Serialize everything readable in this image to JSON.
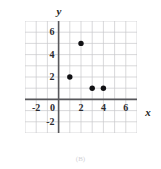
{
  "figure": {
    "caption": "(B)",
    "background_color": "#ffffff"
  },
  "axes": {
    "x_name": "x",
    "y_name": "y",
    "axis_color": "#58585c",
    "grid_color": "#c8c8cc",
    "point_color": "#111114"
  },
  "ticks": {
    "x": [
      {
        "value": -2,
        "label": "-2"
      },
      {
        "value": 0,
        "label": "0"
      },
      {
        "value": 2,
        "label": "2"
      },
      {
        "value": 4,
        "label": "4"
      },
      {
        "value": 6,
        "label": "6"
      }
    ],
    "y": [
      {
        "value": -2,
        "label": "-2"
      },
      {
        "value": 2,
        "label": "2"
      },
      {
        "value": 4,
        "label": "4"
      },
      {
        "value": 6,
        "label": "6"
      }
    ]
  },
  "chart_data": {
    "type": "scatter",
    "title": "",
    "xlabel": "x",
    "ylabel": "y",
    "xlim": [
      -3,
      7
    ],
    "ylim": [
      -3,
      7
    ],
    "xticks": [
      -2,
      0,
      2,
      4,
      6
    ],
    "yticks": [
      -2,
      2,
      4,
      6
    ],
    "grid": true,
    "grid_step": 1,
    "legend": "none",
    "series": [
      {
        "name": "points",
        "points": [
          {
            "x": 1,
            "y": 2
          },
          {
            "x": 2,
            "y": 5
          },
          {
            "x": 3,
            "y": 1
          },
          {
            "x": 4,
            "y": 1
          }
        ]
      }
    ],
    "x": [
      1,
      2,
      3,
      4
    ],
    "y": [
      2,
      5,
      1,
      1
    ]
  }
}
